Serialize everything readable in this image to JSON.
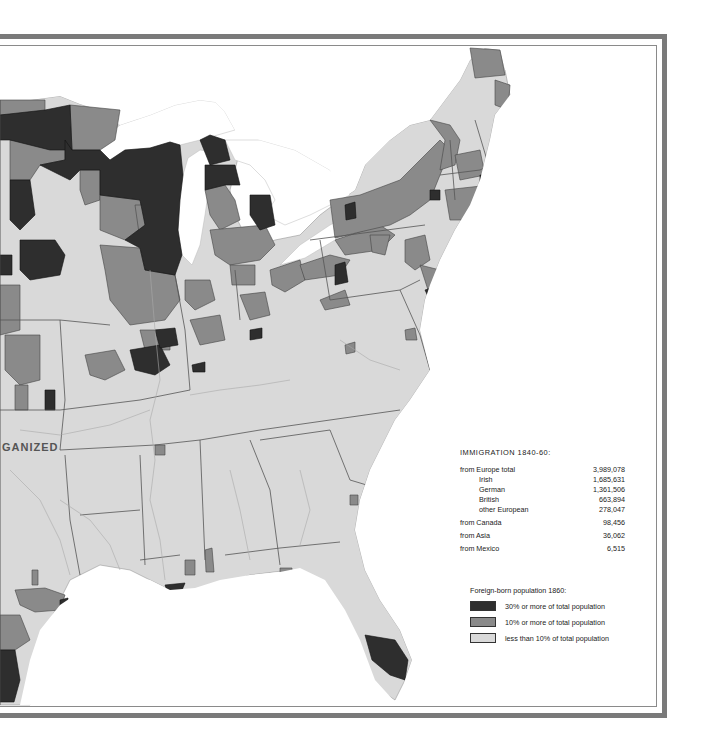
{
  "map": {
    "territory_label": "GANIZED",
    "colors": {
      "high": "#2e2e2e",
      "medium": "#8a8a8a",
      "low": "#d9d9d9",
      "water": "#ffffff",
      "frame": "#7a7a7a"
    }
  },
  "immigration": {
    "title": "IMMIGRATION 1840-60:",
    "europe_total": {
      "label": "from Europe total",
      "value": "3,989,078"
    },
    "europe_breakdown": [
      {
        "label": "Irish",
        "value": "1,685,631"
      },
      {
        "label": "German",
        "value": "1,361,506"
      },
      {
        "label": "British",
        "value": "663,894"
      },
      {
        "label": "other European",
        "value": "278,047"
      }
    ],
    "other_sources": [
      {
        "label": "from Canada",
        "value": "98,456"
      },
      {
        "label": "from Asia",
        "value": "36,062"
      },
      {
        "label": "from Mexico",
        "value": "6,515"
      }
    ]
  },
  "legend": {
    "title": "Foreign-born population 1860:",
    "items": [
      {
        "label": "30% or more of total population",
        "color": "#2e2e2e"
      },
      {
        "label": "10% or more of total population",
        "color": "#8a8a8a"
      },
      {
        "label": "less than 10% of total population",
        "color": "#d9d9d9"
      }
    ]
  }
}
